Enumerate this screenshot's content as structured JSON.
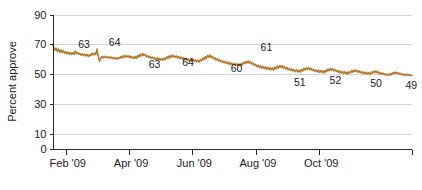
{
  "chart_data": {
    "type": "line",
    "title": "",
    "xlabel": "",
    "ylabel": "Percent approve",
    "ylim": [
      0,
      90
    ],
    "yticks": [
      0,
      10,
      30,
      50,
      70,
      90
    ],
    "ytick_labels": [
      "0",
      "10",
      "30",
      "50",
      "70",
      "90"
    ],
    "gridlines": [
      10,
      30,
      50,
      70,
      90
    ],
    "grid": true,
    "legend": "none",
    "xtick_labels": [
      "Feb '09",
      "Apr '09",
      "Jun '09",
      "Aug '09",
      "Oct '09"
    ],
    "xtick_positions": [
      0.037,
      0.213,
      0.389,
      0.566,
      0.742
    ],
    "series": [
      {
        "name": "Percent approve",
        "color": "#b5782a",
        "values": [
          70.0,
          68.2,
          66.0,
          67.4,
          65.2,
          66.8,
          64.6,
          66.2,
          64.4,
          65.8,
          64.0,
          65.0,
          63.6,
          64.8,
          63.2,
          64.6,
          63.0,
          64.4,
          63.2,
          65.4,
          63.6,
          64.4,
          63.2,
          63.8,
          62.6,
          63.6,
          62.4,
          63.4,
          62.0,
          63.2,
          61.8,
          63.0,
          62.4,
          64.0,
          62.8,
          64.2,
          63.0,
          66.8,
          62.0,
          58.6,
          60.4,
          61.8,
          60.8,
          62.0,
          61.0,
          61.8,
          60.8,
          61.6,
          60.6,
          61.4,
          60.4,
          61.2,
          60.2,
          61.0,
          60.0,
          61.2,
          60.4,
          61.8,
          60.8,
          62.4,
          61.2,
          62.6,
          61.4,
          62.2,
          61.0,
          62.0,
          60.8,
          61.6,
          60.4,
          61.8,
          60.6,
          62.6,
          61.4,
          63.4,
          62.0,
          64.0,
          62.4,
          63.2,
          61.6,
          62.4,
          61.0,
          62.0,
          60.6,
          61.4,
          60.2,
          61.0,
          59.8,
          60.8,
          59.6,
          60.6,
          59.4,
          60.4,
          59.2,
          60.8,
          59.8,
          61.6,
          60.4,
          62.2,
          61.0,
          62.8,
          61.4,
          62.6,
          61.2,
          62.2,
          60.8,
          61.8,
          60.4,
          61.4,
          60.0,
          61.0,
          59.6,
          60.6,
          59.2,
          60.2,
          58.8,
          60.0,
          58.6,
          59.8,
          58.4,
          59.6,
          58.2,
          59.4,
          58.0,
          59.8,
          58.8,
          60.8,
          59.6,
          61.6,
          60.4,
          62.6,
          61.2,
          62.8,
          61.0,
          62.0,
          60.2,
          61.0,
          59.4,
          60.2,
          58.8,
          59.6,
          58.2,
          59.0,
          57.6,
          58.6,
          57.2,
          58.2,
          56.8,
          57.8,
          56.4,
          57.4,
          56.0,
          57.2,
          55.8,
          57.0,
          55.6,
          56.8,
          55.4,
          57.2,
          56.2,
          58.0,
          57.0,
          58.6,
          57.4,
          58.8,
          57.2,
          58.2,
          56.6,
          57.4,
          55.8,
          56.6,
          55.0,
          56.0,
          54.4,
          55.6,
          54.0,
          55.2,
          53.6,
          54.8,
          53.2,
          54.6,
          53.0,
          54.4,
          52.8,
          54.2,
          52.6,
          54.8,
          53.4,
          55.4,
          54.0,
          55.8,
          54.4,
          55.6,
          54.0,
          55.0,
          53.4,
          54.4,
          52.8,
          53.8,
          52.4,
          53.4,
          52.0,
          53.0,
          51.6,
          52.8,
          51.4,
          52.6,
          51.2,
          53.0,
          52.0,
          53.8,
          52.6,
          54.2,
          53.0,
          54.4,
          53.0,
          53.8,
          52.4,
          53.2,
          51.8,
          52.8,
          51.4,
          52.6,
          51.2,
          52.4,
          51.0,
          52.2,
          50.8,
          52.6,
          51.6,
          53.4,
          52.2,
          53.8,
          52.6,
          53.6,
          52.2,
          53.0,
          51.6,
          52.4,
          51.0,
          52.0,
          50.6,
          51.8,
          50.4,
          51.6,
          50.2,
          51.4,
          50.0,
          51.8,
          50.8,
          52.4,
          51.2,
          52.8,
          51.6,
          52.6,
          51.2,
          52.2,
          50.8,
          51.8,
          50.4,
          51.4,
          50.2,
          51.2,
          50.0,
          51.0,
          49.8,
          51.4,
          50.6,
          52.0,
          51.0,
          52.2,
          50.8,
          51.6,
          50.2,
          51.0,
          49.8,
          50.6,
          49.4,
          50.2,
          49.2,
          50.0,
          49.0,
          50.4,
          49.6,
          51.0,
          50.2,
          51.4,
          50.4,
          51.0,
          50.0,
          50.6,
          49.6,
          50.2,
          49.2,
          50.0,
          49.0,
          49.8,
          49.2,
          49.6,
          49.0,
          49.0
        ]
      }
    ],
    "annotations": [
      {
        "label": "63",
        "x_frac": 0.088,
        "value": 63,
        "placement": "above"
      },
      {
        "label": "64",
        "x_frac": 0.173,
        "value": 64,
        "placement": "above"
      },
      {
        "label": "63",
        "x_frac": 0.284,
        "value": 63,
        "placement": "below"
      },
      {
        "label": "64",
        "x_frac": 0.377,
        "value": 64,
        "placement": "below"
      },
      {
        "label": "60",
        "x_frac": 0.512,
        "value": 60,
        "placement": "below"
      },
      {
        "label": "61",
        "x_frac": 0.595,
        "value": 61,
        "placement": "above"
      },
      {
        "label": "51",
        "x_frac": 0.688,
        "value": 51,
        "placement": "below"
      },
      {
        "label": "52",
        "x_frac": 0.787,
        "value": 52,
        "placement": "below"
      },
      {
        "label": "50",
        "x_frac": 0.9,
        "value": 50,
        "placement": "below"
      },
      {
        "label": "49",
        "x_frac": 0.998,
        "value": 49,
        "placement": "below"
      }
    ]
  }
}
